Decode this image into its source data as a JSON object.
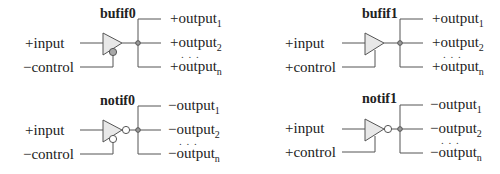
{
  "gates": [
    {
      "id": "bufif0",
      "title": "bufif0",
      "input_label": "+input",
      "control_label": "−control",
      "control_inverted": true,
      "output_inverted": false,
      "outputs": [
        {
          "prefix": "+output",
          "sub": "1"
        },
        {
          "prefix": "+output",
          "sub": "2"
        },
        {
          "prefix": "+output",
          "sub": "n"
        }
      ],
      "ellipsis": ". . ."
    },
    {
      "id": "bufif1",
      "title": "bufif1",
      "input_label": "+input",
      "control_label": "+control",
      "control_inverted": false,
      "output_inverted": false,
      "outputs": [
        {
          "prefix": "+output",
          "sub": "1"
        },
        {
          "prefix": "+output",
          "sub": "2"
        },
        {
          "prefix": "+output",
          "sub": "n"
        }
      ],
      "ellipsis": ". . ."
    },
    {
      "id": "notif0",
      "title": "notif0",
      "input_label": "+input",
      "control_label": "−control",
      "control_inverted": true,
      "output_inverted": true,
      "outputs": [
        {
          "prefix": "−output",
          "sub": "1"
        },
        {
          "prefix": "−output",
          "sub": "2"
        },
        {
          "prefix": "−output",
          "sub": "n"
        }
      ],
      "ellipsis": ". . ."
    },
    {
      "id": "notif1",
      "title": "notif1",
      "input_label": "+input",
      "control_label": "+control",
      "control_inverted": false,
      "output_inverted": true,
      "outputs": [
        {
          "prefix": "−output",
          "sub": "1"
        },
        {
          "prefix": "−output",
          "sub": "2"
        },
        {
          "prefix": "−output",
          "sub": "n"
        }
      ],
      "ellipsis": ". . ."
    }
  ],
  "colors": {
    "wire": "#555555",
    "gate_fill": "#e8e8e8",
    "control_bubble_bufif0": "#a8a8a8",
    "inverter_bubble": "#ffffff",
    "junction_node": "#9a9a9a",
    "text": "#222222"
  }
}
